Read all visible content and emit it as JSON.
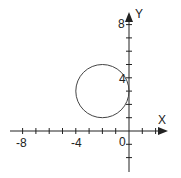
{
  "diagram": {
    "title": "",
    "axes": {
      "x_label": "X",
      "y_label": "Y",
      "origin_label": "0",
      "x_tick_labels": [
        "-8",
        "-4"
      ],
      "y_tick_labels": [
        "8",
        "4"
      ],
      "x_range": [
        -9,
        3
      ],
      "y_range": [
        -3,
        9
      ],
      "tick_step": 1
    },
    "circle": {
      "center": [
        -2,
        3
      ],
      "radius": 2
    },
    "colors": {
      "axis": "#222222",
      "circle": "#444444",
      "background": "#ffffff"
    }
  }
}
